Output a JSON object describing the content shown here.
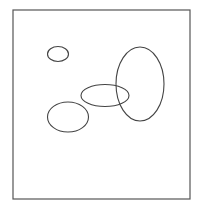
{
  "diagram": {
    "type": "ellipse-diagram",
    "frame": {
      "x": 13,
      "y": 10,
      "width": 177,
      "height": 189,
      "stroke": "#555555",
      "stroke_width": 1.2
    },
    "stroke_color": "#444444",
    "shapes": [
      {
        "id": "small-ellipse",
        "cx": 58,
        "cy": 54,
        "rx": 10.5,
        "ry": 7.5
      },
      {
        "id": "lower-left-ellipse",
        "cx": 68,
        "cy": 117,
        "rx": 20.5,
        "ry": 15
      },
      {
        "id": "horizontal-ellipse",
        "cx": 105,
        "cy": 95.5,
        "rx": 24,
        "ry": 11
      },
      {
        "id": "vertical-ellipse",
        "cx": 140,
        "cy": 84,
        "rx": 24,
        "ry": 37
      }
    ]
  }
}
